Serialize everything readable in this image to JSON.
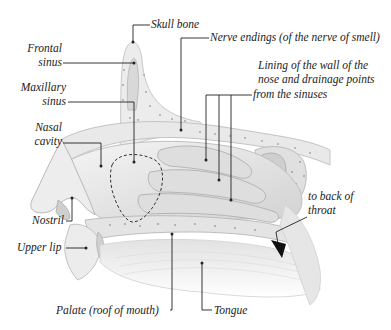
{
  "diagram": {
    "type": "anatomical-cross-section",
    "labels": {
      "skull_bone": "Skull bone",
      "frontal_sinus_1": "Frontal",
      "frontal_sinus_2": "sinus",
      "nerve_endings": "Nerve endings (of the nerve of smell)",
      "lining_1": "Lining of the wall of the",
      "lining_2": "nose and drainage points",
      "lining_3": "from the sinuses",
      "maxillary_1": "Maxillary",
      "maxillary_2": "sinus",
      "nasal_1": "Nasal",
      "nasal_2": "cavity",
      "to_back_1": "to back of",
      "to_back_2": "throat",
      "nostril": "Nostril",
      "upper_lip": "Upper lip",
      "palate": "Palate (roof of mouth)",
      "tongue": "Tongue"
    },
    "colors": {
      "ink": "#222222",
      "tissue_light": "#eeeeee",
      "tissue_mid": "#d6d6d6",
      "tissue_dark": "#b8b8b8",
      "bone_dot": "#9a9a9a"
    }
  }
}
